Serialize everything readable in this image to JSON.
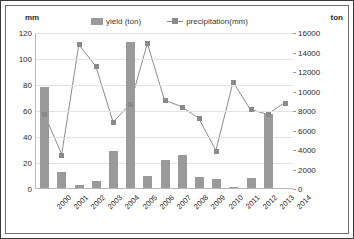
{
  "chart_data": {
    "type": "bar",
    "title": "",
    "categories": [
      "2000",
      "2001",
      "2002",
      "2003",
      "2004",
      "2005",
      "2006",
      "2007",
      "2008",
      "2009",
      "2010",
      "2011",
      "2012",
      "2013",
      "2014"
    ],
    "series": [
      {
        "name": "yield (ton)",
        "type": "bar",
        "axis": "right",
        "color": "#9a9a9a",
        "values": [
          10400,
          1600,
          300,
          700,
          3800,
          15000,
          1200,
          2900,
          3400,
          1100,
          900,
          150,
          1000,
          7600,
          0
        ]
      },
      {
        "name": "precipitation(mm)",
        "type": "line",
        "axis": "left",
        "color": "#8a8a8a",
        "values": [
          57,
          26,
          111,
          94,
          51,
          65,
          112,
          68,
          63,
          54,
          29,
          82,
          61,
          57,
          66
        ]
      }
    ],
    "xlabel": "",
    "ylabel": "mm",
    "y2label": "ton",
    "ylim": [
      0,
      120
    ],
    "y2lim": [
      0,
      16000
    ],
    "yticks": [
      0,
      20,
      40,
      60,
      80,
      100,
      120
    ],
    "y2ticks": [
      0,
      2000,
      4000,
      6000,
      8000,
      10000,
      12000,
      14000,
      16000
    ],
    "grid": true,
    "legend_position": "top"
  },
  "axes": {
    "left_unit": "mm",
    "right_unit": "ton"
  },
  "legend": {
    "items": [
      {
        "label": "yield (ton)",
        "marker": "bar-swatch"
      },
      {
        "label": "precipitation(mm)",
        "marker": "line-square-marker"
      }
    ]
  }
}
